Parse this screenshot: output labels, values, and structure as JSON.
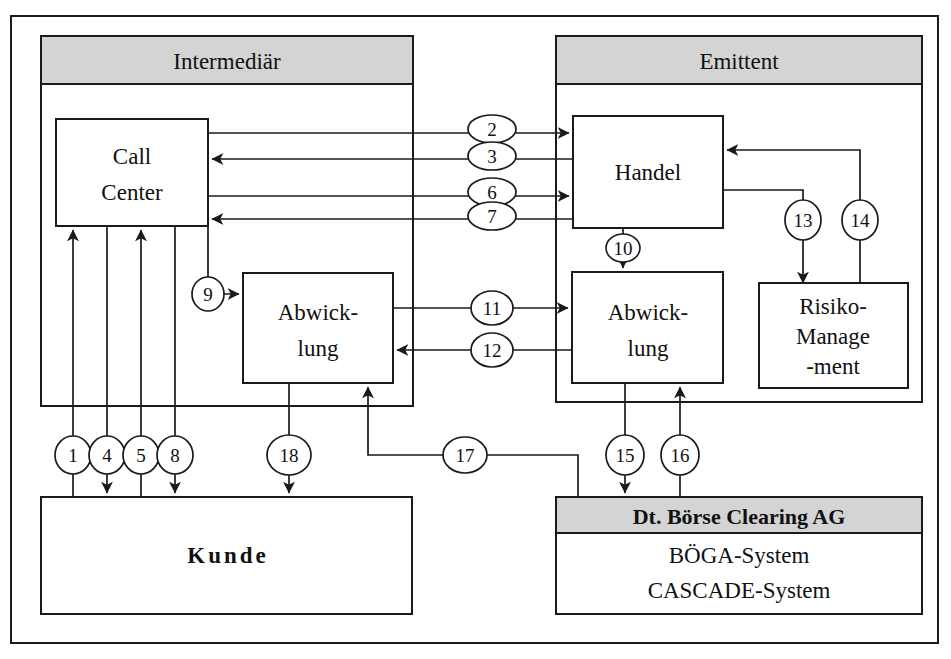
{
  "diagram": {
    "title_visible": false,
    "panels": [
      {
        "id": "intermediaer",
        "label": "Intermediär"
      },
      {
        "id": "emittent",
        "label": "Emittent"
      }
    ],
    "nodes": [
      {
        "id": "call-center",
        "lines": [
          "Call",
          "Center"
        ]
      },
      {
        "id": "abwicklung-links",
        "lines": [
          "Abwick-",
          "lung"
        ]
      },
      {
        "id": "kunde",
        "lines": [
          "Kunde"
        ]
      },
      {
        "id": "handel",
        "lines": [
          "Handel"
        ]
      },
      {
        "id": "abwicklung-rechts",
        "lines": [
          "Abwick-",
          "lung"
        ]
      },
      {
        "id": "risiko-management",
        "lines": [
          "Risiko-",
          "Manage",
          "-ment"
        ]
      },
      {
        "id": "dt-boerse",
        "header": "Dt. Börse Clearing AG",
        "lines": [
          "BÖGA-System",
          "CASCADE-System"
        ]
      }
    ],
    "flow_markers": [
      {
        "id": "1",
        "label": "1"
      },
      {
        "id": "2",
        "label": "2"
      },
      {
        "id": "3",
        "label": "3"
      },
      {
        "id": "4",
        "label": "4"
      },
      {
        "id": "5",
        "label": "5"
      },
      {
        "id": "6",
        "label": "6"
      },
      {
        "id": "7",
        "label": "7"
      },
      {
        "id": "8",
        "label": "8"
      },
      {
        "id": "9",
        "label": "9"
      },
      {
        "id": "10",
        "label": "10"
      },
      {
        "id": "11",
        "label": "11"
      },
      {
        "id": "12",
        "label": "12"
      },
      {
        "id": "13",
        "label": "13"
      },
      {
        "id": "14",
        "label": "14"
      },
      {
        "id": "15",
        "label": "15"
      },
      {
        "id": "16",
        "label": "16"
      },
      {
        "id": "17",
        "label": "17"
      },
      {
        "id": "18",
        "label": "18"
      }
    ],
    "colors": {
      "line": "#1a1a1a",
      "panel_header_fill": "#d4d4d4",
      "box_fill": "#ffffff",
      "page_background": "#ffffff"
    }
  }
}
